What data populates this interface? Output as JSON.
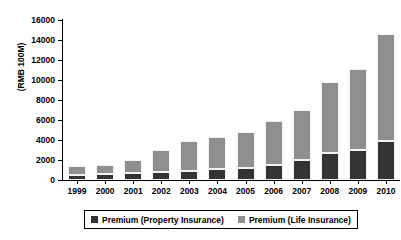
{
  "chart_data": {
    "type": "bar",
    "subtype": "stacked-vertical",
    "title": "",
    "xlabel": "",
    "ylabel": "(RMB 100M)",
    "ylim": [
      0,
      16000
    ],
    "ytick_step": 2000,
    "ytick_labels": [
      "16000",
      "14000",
      "12000",
      "10000",
      "8000",
      "6000",
      "4000",
      "2000",
      "0"
    ],
    "grid": false,
    "legend_position": "bottom-center",
    "categories": [
      "1999",
      "2000",
      "2001",
      "2002",
      "2003",
      "2004",
      "2005",
      "2006",
      "2007",
      "2008",
      "2009",
      "2010"
    ],
    "series": [
      {
        "name": "Premium (Property Insurance)",
        "color": "#333333",
        "values": [
          520,
          600,
          690,
          780,
          870,
          1090,
          1230,
          1510,
          2030,
          2740,
          2990,
          3900
        ]
      },
      {
        "name": "Premium (Life Insurance)",
        "color": "#8f8f8f",
        "values": [
          850,
          950,
          1360,
          2230,
          3030,
          3230,
          3620,
          4370,
          4950,
          7060,
          8100,
          10700
        ]
      }
    ],
    "totals": [
      1370,
      1550,
      2050,
      3010,
      3900,
      4320,
      4850,
      5880,
      6980,
      9800,
      11090,
      14600
    ]
  },
  "legend": {
    "items": [
      {
        "label": "Premium (Property Insurance)",
        "swatch": "property"
      },
      {
        "label": "Premium (Life Insurance)",
        "swatch": "life"
      }
    ]
  }
}
